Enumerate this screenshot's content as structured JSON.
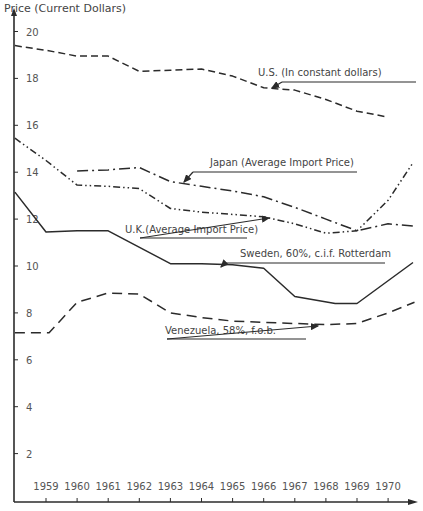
{
  "chart_data": {
    "type": "line",
    "title": "",
    "ylabel": "Price (Current Dollars)",
    "xlabel": "",
    "ylim": [
      0,
      20
    ],
    "xlim": [
      1958,
      1970.85
    ],
    "yticks": [
      2,
      4,
      6,
      8,
      10,
      12,
      14,
      16,
      18,
      20
    ],
    "ytick_labels": [
      "2",
      "4",
      "6",
      "8",
      "10",
      "12",
      "14",
      "16",
      "18",
      "20"
    ],
    "categories": [
      "1959",
      "1960",
      "1961",
      "1962",
      "1963",
      "1964",
      "1965",
      "1966",
      "1967",
      "1968",
      "1969",
      "1970"
    ],
    "grid": false,
    "legend": "inline annotations with leader arrows",
    "series": [
      {
        "name": "U.S. (In constant dollars)",
        "style": "dashed",
        "points": [
          [
            1958.0,
            19.4
          ],
          [
            1959.0,
            19.2
          ],
          [
            1960.0,
            18.95
          ],
          [
            1961.0,
            18.95
          ],
          [
            1962.0,
            18.3
          ],
          [
            1963.0,
            18.35
          ],
          [
            1964.0,
            18.4
          ],
          [
            1965.0,
            18.1
          ],
          [
            1966.0,
            17.6
          ],
          [
            1967.0,
            17.5
          ],
          [
            1968.0,
            17.1
          ],
          [
            1969.0,
            16.6
          ],
          [
            1970.0,
            16.35
          ]
        ],
        "values": [
          19.2,
          18.95,
          18.95,
          18.3,
          18.35,
          18.4,
          18.1,
          17.6,
          17.5,
          17.1,
          16.6,
          16.35
        ]
      },
      {
        "name": "Japan (Average Import Price)",
        "style": "dash-dot",
        "points": [
          [
            1960.0,
            14.05
          ],
          [
            1961.0,
            14.1
          ],
          [
            1962.0,
            14.2
          ],
          [
            1963.0,
            13.6
          ],
          [
            1964.0,
            13.4
          ],
          [
            1965.0,
            13.2
          ],
          [
            1966.0,
            12.95
          ],
          [
            1967.0,
            12.5
          ],
          [
            1968.0,
            12.0
          ],
          [
            1969.0,
            11.5
          ],
          [
            1970.0,
            11.8
          ],
          [
            1970.8,
            11.7
          ]
        ],
        "values": [
          null,
          14.05,
          14.1,
          14.2,
          13.6,
          13.4,
          13.2,
          12.95,
          12.5,
          12.0,
          11.5,
          11.8
        ]
      },
      {
        "name": "U.K. (Average Import Price)",
        "style": "dash-dot-dot",
        "points": [
          [
            1958.0,
            15.45
          ],
          [
            1959.0,
            14.5
          ],
          [
            1960.0,
            13.45
          ],
          [
            1961.0,
            13.4
          ],
          [
            1962.0,
            13.3
          ],
          [
            1963.0,
            12.45
          ],
          [
            1964.0,
            12.3
          ],
          [
            1965.0,
            12.2
          ],
          [
            1966.0,
            12.1
          ],
          [
            1967.0,
            11.8
          ],
          [
            1968.0,
            11.4
          ],
          [
            1969.0,
            11.5
          ],
          [
            1970.0,
            12.8
          ],
          [
            1970.8,
            14.4
          ]
        ],
        "values": [
          14.5,
          13.45,
          13.4,
          13.3,
          12.45,
          12.3,
          12.2,
          12.1,
          11.8,
          11.4,
          11.5,
          12.8
        ]
      },
      {
        "name": "Sweden, 60%, c.i.f. Rotterdam",
        "style": "solid",
        "points": [
          [
            1958.0,
            13.15
          ],
          [
            1959.0,
            11.45
          ],
          [
            1960.0,
            11.5
          ],
          [
            1961.0,
            11.5
          ],
          [
            1963.0,
            10.1
          ],
          [
            1964.0,
            10.1
          ],
          [
            1965.0,
            10.05
          ],
          [
            1966.0,
            9.9
          ],
          [
            1967.0,
            8.7
          ],
          [
            1968.3,
            8.4
          ],
          [
            1969.0,
            8.4
          ],
          [
            1970.8,
            10.15
          ]
        ],
        "values": [
          11.45,
          11.5,
          11.5,
          10.8,
          10.1,
          10.1,
          10.05,
          9.9,
          8.7,
          8.45,
          8.4,
          9.4
        ]
      },
      {
        "name": "Venezuela, 58%, f.o.b.",
        "style": "long-dashed",
        "points": [
          [
            1958.0,
            7.15
          ],
          [
            1959.1,
            7.15
          ],
          [
            1960.0,
            8.45
          ],
          [
            1961.0,
            8.85
          ],
          [
            1962.0,
            8.8
          ],
          [
            1963.0,
            8.0
          ],
          [
            1964.0,
            7.8
          ],
          [
            1965.0,
            7.65
          ],
          [
            1966.0,
            7.6
          ],
          [
            1967.0,
            7.55
          ],
          [
            1968.0,
            7.5
          ],
          [
            1969.0,
            7.55
          ],
          [
            1970.0,
            8.0
          ],
          [
            1970.85,
            8.45
          ]
        ],
        "values": [
          7.15,
          8.45,
          8.85,
          8.8,
          8.0,
          7.8,
          7.65,
          7.6,
          7.55,
          7.5,
          7.55,
          8.0
        ]
      }
    ],
    "annotations": [
      {
        "text": "U.S. (In constant dollars)",
        "target_series": "U.S. (In constant dollars)"
      },
      {
        "text": "Japan (Average Import Price)",
        "target_series": "Japan (Average Import Price)"
      },
      {
        "text": "U.K.(Average Import Price)",
        "target_series": "U.K. (Average Import Price)"
      },
      {
        "text": "Sweden, 60%, c.i.f. Rotterdam",
        "target_series": "Sweden, 60%, c.i.f. Rotterdam"
      },
      {
        "text": "Venezuela, 58%, f.o.b.",
        "target_series": "Venezuela, 58%, f.o.b."
      }
    ]
  },
  "layout": {
    "x0": 46,
    "x_per_year": 31.1,
    "y_top_value": 20,
    "y_top_px": 31.5,
    "y_per_unit": 23.45,
    "axis_x": 14,
    "axis_y": 502,
    "axis_right": 416,
    "axis_top": 8,
    "line_color": "#2b2b2b",
    "annotation_positions": [
      {
        "x": 258,
        "y": 76,
        "line_from": [
          282,
          82
        ],
        "line_to": [
          416,
          82
        ],
        "arrow_to": [
          272,
          88
        ]
      },
      {
        "x": 210,
        "y": 166,
        "line_from": [
          193,
          172
        ],
        "line_to": [
          357,
          172
        ],
        "arrow_to": [
          184,
          182
        ]
      },
      {
        "x": 125,
        "y": 233,
        "line_from": [
          140,
          238
        ],
        "line_to": [
          247,
          238
        ],
        "arrow_to": [
          269,
          218
        ]
      },
      {
        "x": 240,
        "y": 257,
        "line_from": [
          225,
          263
        ],
        "line_to": [
          385,
          263
        ],
        "arrow_to": [
          221,
          267
        ]
      },
      {
        "x": 165,
        "y": 334,
        "line_from": [
          167,
          339
        ],
        "line_to": [
          306,
          339
        ],
        "arrow_to": [
          318,
          326
        ]
      }
    ]
  }
}
